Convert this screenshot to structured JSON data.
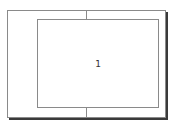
{
  "thumbnail": {
    "frame_label": "1"
  }
}
